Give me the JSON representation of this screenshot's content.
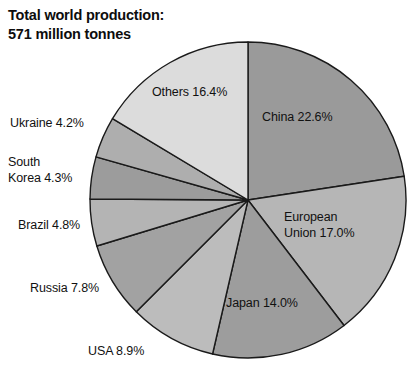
{
  "title": {
    "line1": "Total world production:",
    "line2": "571 million tonnes"
  },
  "labels": {
    "china": "China 22.6%",
    "european_union": "European\nUnion 17.0%",
    "japan": "Japan 14.0%",
    "usa": "USA 8.9%",
    "russia": "Russia 7.8%",
    "brazil": "Brazil 4.8%",
    "south_korea": "South\nKorea 4.3%",
    "ukraine": "Ukraine 4.2%",
    "others": "Others 16.4%"
  },
  "chart_data": {
    "type": "pie",
    "total_label": "571 million tonnes",
    "total_value": 571,
    "units": "million tonnes",
    "start_angle_deg": 0,
    "direction": "clockwise",
    "grid": false,
    "legend": "none",
    "labels_position": "mixed-inside-and-outside",
    "categories": [
      "China",
      "European Union",
      "Japan",
      "USA",
      "Russia",
      "Brazil",
      "South Korea",
      "Ukraine",
      "Others"
    ],
    "values": [
      22.6,
      17.0,
      14.0,
      8.9,
      7.8,
      4.8,
      4.3,
      4.2,
      16.4
    ],
    "value_unit": "percent",
    "slices": [
      {
        "name": "China",
        "value": 22.6,
        "label": "China 22.6%",
        "color": "#9a9a9a",
        "label_placement": "inside"
      },
      {
        "name": "European Union",
        "value": 17.0,
        "label": "European Union 17.0%",
        "color": "#b6b6b6",
        "label_placement": "inside"
      },
      {
        "name": "Japan",
        "value": 14.0,
        "label": "Japan 14.0%",
        "color": "#9d9d9d",
        "label_placement": "inside"
      },
      {
        "name": "USA",
        "value": 8.9,
        "label": "USA 8.9%",
        "color": "#bcbcbc",
        "label_placement": "outside"
      },
      {
        "name": "Russia",
        "value": 7.8,
        "label": "Russia 7.8%",
        "color": "#a2a2a2",
        "label_placement": "outside"
      },
      {
        "name": "Brazil",
        "value": 4.8,
        "label": "Brazil 4.8%",
        "color": "#b4b4b4",
        "label_placement": "outside"
      },
      {
        "name": "South Korea",
        "value": 4.3,
        "label": "South Korea 4.3%",
        "color": "#9c9c9c",
        "label_placement": "outside"
      },
      {
        "name": "Ukraine",
        "value": 4.2,
        "label": "Ukraine 4.2%",
        "color": "#aeaeae",
        "label_placement": "outside"
      },
      {
        "name": "Others",
        "value": 16.4,
        "label": "Others 16.4%",
        "color": "#dcdcdc",
        "label_placement": "inside"
      }
    ],
    "geometry": {
      "center_x": 248,
      "center_y": 200,
      "radius": 158
    },
    "colors": {
      "outline": "#1a1a1a",
      "background": "#ffffff",
      "text": "#111111"
    }
  }
}
